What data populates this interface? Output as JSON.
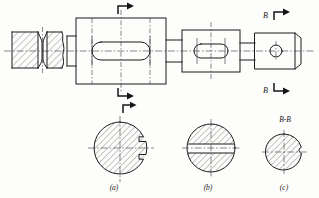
{
  "drawing": {
    "type": "mechanical-engineering-orthographic-drawing",
    "sheet": {
      "width": 319,
      "height": 198,
      "background_color": "#fdfdfc",
      "line_color": "#1b1b1b"
    },
    "section_marks": {
      "top_unlabeled": {
        "label": "",
        "arrow_direction": "right",
        "x": 123,
        "y": 11
      },
      "bottom_unlabeled": {
        "label": "",
        "arrow_direction": "right",
        "x": 123,
        "y": 92
      },
      "top_b": {
        "label": "B",
        "arrow_direction": "right",
        "x": 272,
        "y": 16
      },
      "bottom_b": {
        "label": "B",
        "arrow_direction": "right",
        "x": 272,
        "y": 89
      },
      "view_a_mark": {
        "label": "",
        "arrow_direction": "right",
        "x": 126,
        "y": 105
      }
    },
    "section_views": [
      {
        "id": "view-a",
        "caption": "(a)",
        "title": "",
        "center_x": 120,
        "center_y": 148,
        "radius": 26,
        "feature": "single-side-keyway-notch",
        "hatched": true
      },
      {
        "id": "view-b",
        "caption": "(b)",
        "title": "",
        "center_x": 211,
        "center_y": 148,
        "radius": 24,
        "feature": "two-parallel-flats-central-band",
        "hatched": true
      },
      {
        "id": "view-c",
        "caption": "(c)",
        "title": "B-B",
        "center_x": 284,
        "center_y": 152,
        "radius": 18,
        "feature": "small-side-notch",
        "hatched": true
      }
    ],
    "main_view": {
      "description": "front elevation of stepped shaft with sectioned left end, rectangular body with oblong slot, middle block with oblong slot and right end block with circular bore",
      "features": [
        {
          "name": "left-hatched-collar",
          "x": 12,
          "y": 32,
          "width": 26,
          "height": 36
        },
        {
          "name": "left-groove",
          "x": 38,
          "y": 34,
          "width": 8,
          "height": 32
        },
        {
          "name": "second-hatched-collar-with-break",
          "x": 46,
          "y": 30,
          "width": 22,
          "height": 40
        },
        {
          "name": "main-body-rectangle",
          "x": 76,
          "y": 18,
          "width": 90,
          "height": 66
        },
        {
          "name": "main-body-slot",
          "cx": 121,
          "cy": 51,
          "length": 58,
          "height": 18
        },
        {
          "name": "middle-block",
          "x": 182,
          "y": 30,
          "width": 58,
          "height": 42
        },
        {
          "name": "middle-block-slot",
          "cx": 211,
          "cy": 51,
          "length": 34,
          "height": 14
        },
        {
          "name": "right-block",
          "x": 255,
          "y": 33,
          "width": 46,
          "height": 36
        },
        {
          "name": "right-block-bore",
          "cx": 276,
          "cy": 51,
          "r": 6
        }
      ]
    }
  }
}
